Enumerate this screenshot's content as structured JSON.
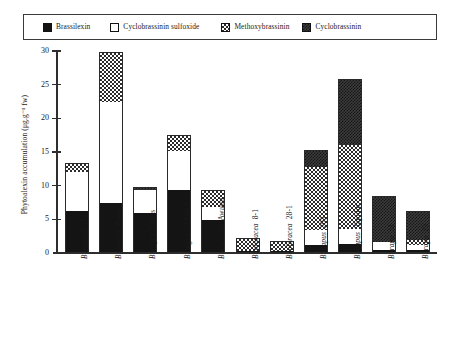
{
  "legend": {
    "entries": [
      {
        "label": "Brassilexin",
        "pattern": "solid",
        "color": "#141414"
      },
      {
        "label": "Cyclobrassinin sulfoxide",
        "pattern": "open",
        "color": "#ffffff"
      },
      {
        "label": "Methoxybrassinin",
        "pattern": "check",
        "color": "#2b2b2b"
      },
      {
        "label": "Cyclobrassinin",
        "pattern": "dots",
        "color": "#3c3c3c"
      }
    ]
  },
  "axes": {
    "y_title": "Phytoalexin accumulation (μg.g⁻¹ fw)",
    "y_ticks": [
      "0",
      "5",
      "10",
      "15",
      "20",
      "25",
      "30"
    ]
  },
  "chart_data": {
    "type": "bar",
    "title": "",
    "subtitle": "",
    "xlabel": "",
    "ylabel": "Phytoalexin accumulation (μg.g⁻¹ fw)",
    "ylim": [
      0,
      30
    ],
    "ytick_interval": 5,
    "grid": false,
    "stacked": true,
    "legend_position": "top",
    "categories": [
      "B. juncea 172",
      "B. juncea Aurea",
      "B. nigra Junius",
      "B. nigra 72.096.1",
      "B. carinata Awassa",
      "B. oleracea 8-1",
      "B. oleracea 28-1",
      "B. napus 203",
      "B. napus Tapidor",
      "B. rapa 34",
      "B. rapa 29"
    ],
    "series": [
      {
        "name": "Brassilexin",
        "pattern": "solid",
        "values": [
          6.2,
          7.5,
          6.0,
          9.3,
          4.9,
          0.3,
          0.3,
          1.2,
          1.3,
          0.5,
          0.4
        ]
      },
      {
        "name": "Cyclobrassinin sulfoxide",
        "pattern": "open",
        "values": [
          5.9,
          14.9,
          3.4,
          5.9,
          1.9,
          0.0,
          0.0,
          2.2,
          2.2,
          1.1,
          0.8
        ]
      },
      {
        "name": "Methoxybrassinin",
        "pattern": "check",
        "values": [
          1.2,
          7.5,
          0.0,
          2.4,
          2.6,
          1.9,
          1.5,
          9.4,
          12.5,
          0.0,
          0.7
        ]
      },
      {
        "name": "Cyclobrassinin",
        "pattern": "dots",
        "values": [
          0.0,
          0.0,
          0.4,
          0.0,
          0.0,
          0.0,
          0.0,
          2.5,
          9.9,
          6.8,
          4.4
        ]
      }
    ],
    "totals": [
      13.3,
      29.9,
      9.8,
      17.6,
      9.4,
      2.2,
      1.8,
      15.3,
      25.9,
      8.4,
      6.3
    ]
  }
}
